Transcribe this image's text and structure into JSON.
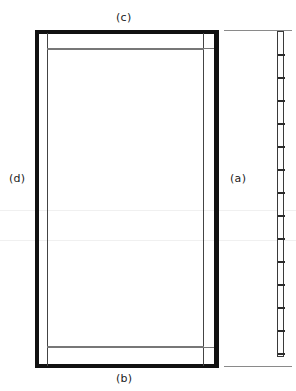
{
  "figure": {
    "type": "engineering-drawing",
    "width": 296,
    "height": 391,
    "background_color": "#ffffff",
    "line_color": "#111111",
    "hairline_color": "#777777"
  },
  "labels": {
    "top": "(c)",
    "bottom": "(b)",
    "left": "(d)",
    "right": "(a)"
  },
  "front_view": {
    "name": "frame-front-elevation",
    "outer": {
      "x": 35,
      "y": 30,
      "width": 184,
      "height": 338
    },
    "stile_thickness": 5,
    "inner_offset": 12,
    "top_rail_y": 48,
    "bottom_rail_y": 346
  },
  "edge_view": {
    "name": "frame-edge-section",
    "x": 277,
    "y": 31,
    "width": 7,
    "height": 326,
    "tick_count": 14,
    "tick_positions": [
      31,
      54,
      77,
      100,
      123,
      146,
      169,
      192,
      215,
      238,
      261,
      284,
      307,
      330,
      357
    ]
  },
  "projection_lines": {
    "top_y": 30,
    "bottom_y": 366,
    "x_start": 224,
    "x_end": 292
  },
  "scanlines": [
    210,
    240
  ]
}
